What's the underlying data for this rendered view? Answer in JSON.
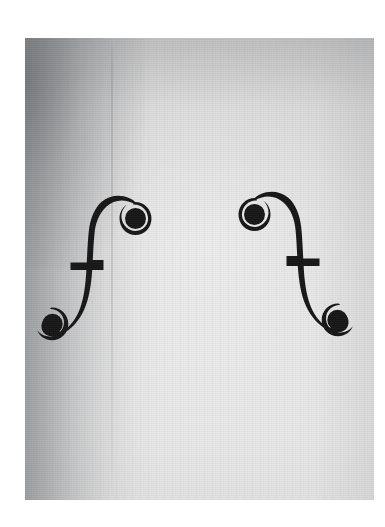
{
  "image": {
    "subject": "violin f-holes",
    "description": "Black-and-white close-up photograph of the two f-holes (sound holes) cut into the spruce top plate of a violin",
    "medium": "monochrome photograph",
    "orientation": "portrait",
    "canvas": {
      "width": 385,
      "height": 527,
      "background": "#ffffff"
    },
    "photo_region": {
      "left": 25,
      "top": 38,
      "width": 349,
      "height": 462
    },
    "tones": {
      "paper_white_border": "#ffffff",
      "plate_light": "#e6e6e6",
      "plate_mid": "#d6d6d6",
      "plate_shadow": "#8b8d91",
      "plate_deep_shadow": "#5a5c60",
      "fhole_black": "#111111"
    },
    "features": [
      {
        "name": "left-f-hole",
        "label": "Left f-hole (bass side)",
        "orientation": "upper eye at top-right, lower eye at bottom-left",
        "bounds": {
          "x": 40,
          "y": 196,
          "width": 108,
          "height": 150
        },
        "nick_y": 269
      },
      {
        "name": "right-f-hole",
        "label": "Right f-hole (treble side)",
        "orientation": "mirrored: upper eye at top-left, lower eye at bottom-right",
        "bounds": {
          "x": 243,
          "y": 192,
          "width": 107,
          "height": 150
        },
        "nick_y": 263
      },
      {
        "name": "centre-joint-seam",
        "label": "Centre joint seam of the two-piece spruce top",
        "x": 111
      },
      {
        "name": "left-shadow",
        "label": "Shadow gradient falling across the left flank of the plate"
      },
      {
        "name": "spruce-grain",
        "label": "Vertical spruce grain lines running the height of the plate"
      }
    ]
  }
}
